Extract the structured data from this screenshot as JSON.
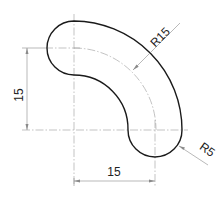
{
  "drawing": {
    "type": "technical-drawing",
    "subject": "curved slot / bent link part",
    "dimensions": {
      "vertical_label": "15",
      "horizontal_label": "15",
      "centerline_radius_label": "R15",
      "end_radius_label": "R5"
    },
    "colors": {
      "outline": "#1a1a1a",
      "centerline": "#9a9a9a",
      "dimension": "#8a8a8a",
      "background": "#ffffff"
    }
  }
}
